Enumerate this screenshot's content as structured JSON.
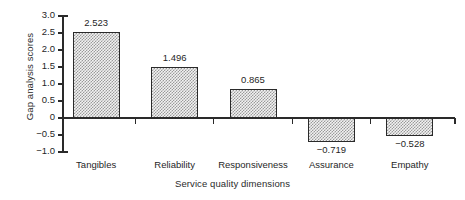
{
  "chart_data": {
    "type": "bar",
    "title": "",
    "xlabel": "Service quality dimensions",
    "ylabel": "Gap analysis scores",
    "categories": [
      "Tangibles",
      "Reliability",
      "Responsiveness",
      "Assurance",
      "Empathy"
    ],
    "values": [
      2.523,
      1.496,
      0.865,
      -0.719,
      -0.528
    ],
    "value_labels": [
      "2.523",
      "1.496",
      "0.865",
      "−0.719",
      "−0.528"
    ],
    "ylim": [
      -1.0,
      3.0
    ],
    "ytick_values": [
      3.0,
      2.5,
      2.0,
      1.5,
      1.0,
      0.5,
      0.0,
      -0.5,
      -1.0
    ],
    "ytick_labels": [
      "3.0",
      "2.5",
      "2.0",
      "1.5",
      "1.0",
      "0.5",
      "0",
      "−0.5",
      "−1.0"
    ],
    "grid": false,
    "legend": null,
    "bar_fill": "#f2f2f2",
    "bar_pattern": "checkerboard-stipple",
    "bar_edge_color": "#2a2a2a",
    "axis_color": "#2a2a2a",
    "background": "#ffffff"
  }
}
